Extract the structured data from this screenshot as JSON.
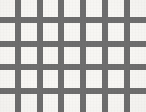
{
  "image": {
    "kind": "grid-lattice-pattern",
    "width": 146,
    "height": 112,
    "background_color": "#f7f6f3",
    "bar_color": "#6e6e6e",
    "caption": ""
  },
  "chart_data": {
    "type": "heatmap",
    "title": "",
    "subtitle": "",
    "xlabel": "",
    "ylabel": "",
    "grid": true,
    "legend_position": "none",
    "bar_thickness": 6,
    "vertical_bars": {
      "count": 6,
      "orientation": "vertical",
      "pitch": 21.8,
      "x_positions": [
        15,
        37,
        58,
        80,
        102,
        124
      ],
      "span_y": [
        0,
        112
      ]
    },
    "horizontal_bars": {
      "count": 4,
      "orientation": "horizontal",
      "pitch": 23.6,
      "y_positions": [
        17,
        41,
        64,
        88
      ],
      "span_x": [
        0,
        146
      ]
    },
    "cell_counts": {
      "columns": 7,
      "rows": 5
    }
  }
}
